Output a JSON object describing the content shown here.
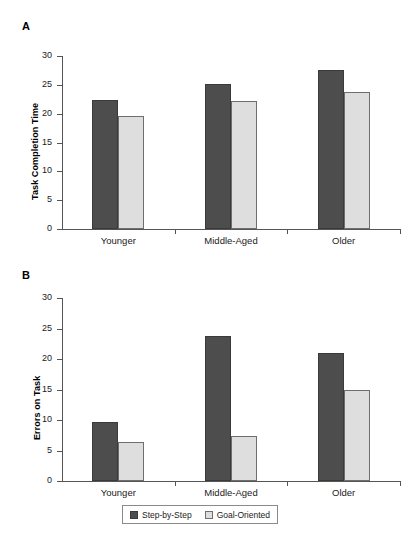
{
  "figure": {
    "panels": [
      {
        "letter": "A",
        "ylabel": "Task Completion Time"
      },
      {
        "letter": "B",
        "ylabel": "Errors on Task"
      }
    ]
  },
  "legend": {
    "items": [
      {
        "label": "Step-by-Step",
        "color": "#4d4d4d",
        "swatch": "dark"
      },
      {
        "label": "Goal-Oriented",
        "color": "#dedede",
        "swatch": "light"
      }
    ]
  },
  "chart_data": [
    {
      "type": "bar",
      "panel": "A",
      "title": "",
      "xlabel": "",
      "ylabel": "Task Completion Time",
      "categories": [
        "Younger",
        "Middle-Aged",
        "Older"
      ],
      "yticks": [
        0,
        5,
        10,
        15,
        20,
        25,
        30
      ],
      "ylim": [
        0,
        30
      ],
      "grid": false,
      "legend_position": "below-figure",
      "series": [
        {
          "name": "Step-by-Step",
          "color": "#4d4d4d",
          "values": [
            22.4,
            25.2,
            27.5
          ]
        },
        {
          "name": "Goal-Oriented",
          "color": "#dedede",
          "values": [
            19.6,
            22.2,
            23.8
          ]
        }
      ]
    },
    {
      "type": "bar",
      "panel": "B",
      "title": "",
      "xlabel": "",
      "ylabel": "Errors on Task",
      "categories": [
        "Younger",
        "Middle-Aged",
        "Older"
      ],
      "yticks": [
        0,
        5,
        10,
        15,
        20,
        25,
        30
      ],
      "ylim": [
        0,
        30
      ],
      "grid": false,
      "legend_position": "below-figure",
      "series": [
        {
          "name": "Step-by-Step",
          "color": "#4d4d4d",
          "values": [
            9.6,
            23.8,
            21.0
          ]
        },
        {
          "name": "Goal-Oriented",
          "color": "#dedede",
          "values": [
            6.4,
            7.3,
            14.9
          ]
        }
      ]
    }
  ]
}
